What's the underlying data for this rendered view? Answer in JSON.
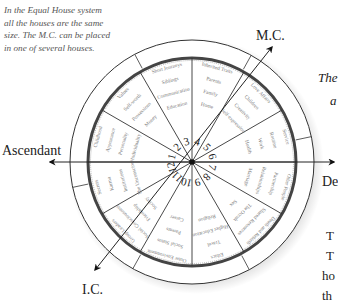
{
  "caption": {
    "lines": [
      "In the Equal House system",
      "all the houses are the same",
      "size. The M.C. can be placed",
      "in one of several houses."
    ]
  },
  "axes": {
    "mc": "M.C.",
    "ic": "I.C.",
    "ascendant": "Ascendant",
    "descendant": "De"
  },
  "side_text": {
    "italic_line1": "The",
    "italic_line2": "a",
    "body_line1": "T",
    "body_line2": "T",
    "body_line3": "ho",
    "body_line4": "th"
  },
  "houses": [
    {
      "number": "1",
      "keywords": [
        "Individuality",
        "Personality",
        "Appearance",
        "Childhood"
      ]
    },
    {
      "number": "2",
      "keywords": [
        "Money",
        "Possessions",
        "Self-worth",
        "Values"
      ]
    },
    {
      "number": "3",
      "keywords": [
        "Education",
        "Communication",
        "Siblings",
        "Short Journeys"
      ]
    },
    {
      "number": "4",
      "keywords": [
        "Home",
        "Family",
        "Parents",
        "Inherited Traits"
      ]
    },
    {
      "number": "5",
      "keywords": [
        "Self-expression",
        "Creativity",
        "Children",
        "Love Affairs"
      ]
    },
    {
      "number": "6",
      "keywords": [
        "Health",
        "Work",
        "Routine",
        "Service"
      ]
    },
    {
      "number": "7",
      "keywords": [
        "Marriage",
        "Relationships",
        "Partnership",
        "Other People"
      ]
    },
    {
      "number": "8",
      "keywords": [
        "Sex",
        "The Occult",
        "Shared Resources",
        "Death and Rebirth"
      ]
    },
    {
      "number": "9",
      "keywords": [
        "Religion",
        "Higher Education",
        "Travel",
        "Ethics"
      ]
    },
    {
      "number": "10",
      "keywords": [
        "Career",
        "Parents",
        "Social Status",
        "Outer Environment"
      ]
    },
    {
      "number": "11",
      "keywords": [
        "Society",
        "Friendship",
        "Social Consciousness",
        "Group Leaders"
      ]
    },
    {
      "number": "12",
      "keywords": [
        "The Unconscious",
        "Institutions",
        "Karma",
        "Secrets"
      ]
    }
  ],
  "colors": {
    "line": "#333333",
    "text": "#222222",
    "keyword": "#777777",
    "ring_dark": "#444444"
  }
}
